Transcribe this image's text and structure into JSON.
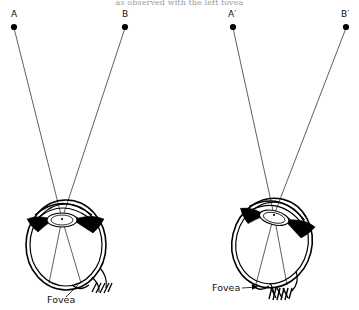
{
  "figure": {
    "caption_clipped": "as observed with the left fovea",
    "background_color": "#ffffff",
    "ink_color": "#000000",
    "width": 359,
    "height": 310
  },
  "diagrams": [
    {
      "id": "left-eye",
      "name": "left-eye-diagram",
      "fovea_label": "Fovea",
      "fovea_label_side": "below",
      "points": [
        {
          "id": "A",
          "label": "A",
          "x": 14,
          "y": 27,
          "label_x": 11,
          "label_y": 17
        },
        {
          "id": "B",
          "label": "B",
          "x": 125,
          "y": 27,
          "label_x": 122,
          "label_y": 17
        }
      ],
      "nodal_point": {
        "x": 62,
        "y": 219
      },
      "pupil": {
        "x": 61,
        "y": 205
      },
      "eyeball_center": {
        "x": 65,
        "y": 245
      },
      "rays": [
        {
          "from": "A",
          "to": "fovea"
        },
        {
          "from": "B",
          "to": "fovea"
        }
      ]
    },
    {
      "id": "right-eye",
      "name": "right-eye-diagram",
      "fovea_label": "Fovea",
      "fovea_label_side": "left",
      "points": [
        {
          "id": "A-prime",
          "label": "A′",
          "x": 233,
          "y": 27,
          "label_x": 228,
          "label_y": 17
        },
        {
          "id": "B-prime",
          "label": "B′",
          "x": 346,
          "y": 27,
          "label_x": 341,
          "label_y": 17
        }
      ],
      "nodal_point": {
        "x": 274,
        "y": 215
      },
      "pupil": {
        "x": 272,
        "y": 200
      },
      "eyeball_center": {
        "x": 272,
        "y": 243
      },
      "rays": [
        {
          "from": "A-prime",
          "to": "fovea"
        },
        {
          "from": "B-prime",
          "to": "fovea"
        }
      ]
    }
  ],
  "anatomy_parts": [
    "cornea",
    "iris",
    "lens",
    "pupil",
    "sclera",
    "retina",
    "fovea",
    "optic-nerve"
  ]
}
